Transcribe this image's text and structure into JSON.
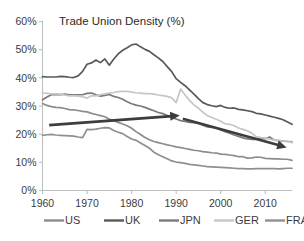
{
  "chart_data": {
    "type": "line",
    "title": "Trade Union Density (%)",
    "xlabel": "",
    "ylabel": "",
    "xlim": [
      1960,
      2016
    ],
    "ylim": [
      0,
      60
    ],
    "grid": false,
    "legend_position": "bottom",
    "ytick_labels": [
      "0%",
      "10%",
      "20%",
      "30%",
      "40%",
      "50%",
      "60%"
    ],
    "ytick_values": [
      0,
      10,
      20,
      30,
      40,
      50,
      60
    ],
    "xtick_labels": [
      "1960",
      "1970",
      "1980",
      "1990",
      "2000",
      "2010"
    ],
    "xtick_values": [
      1960,
      1970,
      1980,
      1990,
      2000,
      2010
    ],
    "x": [
      1960,
      1961,
      1962,
      1963,
      1964,
      1965,
      1966,
      1967,
      1968,
      1969,
      1970,
      1971,
      1972,
      1973,
      1974,
      1975,
      1976,
      1977,
      1978,
      1979,
      1980,
      1981,
      1982,
      1983,
      1984,
      1985,
      1986,
      1987,
      1988,
      1989,
      1990,
      1991,
      1992,
      1993,
      1994,
      1995,
      1996,
      1997,
      1998,
      1999,
      2000,
      2001,
      2002,
      2003,
      2004,
      2005,
      2006,
      2007,
      2008,
      2009,
      2010,
      2011,
      2012,
      2013,
      2014,
      2015,
      2016
    ],
    "series": [
      {
        "name": "US",
        "color": "#8c8c8c",
        "values": [
          30.9,
          30.2,
          29.8,
          29.5,
          29.4,
          29.1,
          28.7,
          28.6,
          28.4,
          28.1,
          27.9,
          27.4,
          27.0,
          26.6,
          26.2,
          25.3,
          24.8,
          24.2,
          23.6,
          23.0,
          22.1,
          20.9,
          19.9,
          18.8,
          18.0,
          17.4,
          17.0,
          16.6,
          16.2,
          15.9,
          15.5,
          15.2,
          14.9,
          14.6,
          14.3,
          14.1,
          13.8,
          13.6,
          13.4,
          13.3,
          12.9,
          12.8,
          12.6,
          12.4,
          12.0,
          12.0,
          11.5,
          11.6,
          11.9,
          11.8,
          11.4,
          11.3,
          11.2,
          11.2,
          11.1,
          11.1,
          10.7
        ]
      },
      {
        "name": "UK",
        "color": "#595959",
        "values": [
          40.4,
          40.3,
          40.3,
          40.3,
          40.5,
          40.4,
          40.2,
          40.1,
          40.7,
          42.3,
          44.8,
          45.3,
          46.3,
          45.4,
          46.7,
          44.5,
          46.7,
          48.5,
          49.8,
          50.7,
          51.7,
          52.0,
          51.0,
          50.1,
          49.4,
          48.2,
          47.1,
          45.8,
          44.0,
          42.2,
          39.7,
          38.4,
          37.2,
          35.7,
          34.2,
          32.6,
          31.2,
          30.5,
          30.1,
          29.8,
          30.2,
          29.5,
          29.2,
          29.3,
          28.8,
          28.6,
          28.3,
          28.0,
          27.4,
          27.2,
          26.8,
          26.4,
          26.0,
          25.6,
          25.1,
          24.3,
          23.5
        ]
      },
      {
        "name": "JPN",
        "color": "#7a7a7a",
        "values": [
          32.2,
          33.2,
          34.0,
          34.0,
          34.0,
          34.2,
          34.0,
          34.0,
          34.0,
          34.0,
          34.5,
          34.6,
          34.0,
          33.5,
          33.8,
          34.1,
          33.4,
          33.0,
          32.4,
          31.5,
          30.8,
          30.3,
          30.0,
          29.5,
          28.9,
          28.3,
          27.7,
          27.3,
          26.6,
          25.9,
          25.4,
          24.8,
          24.5,
          24.2,
          24.1,
          23.8,
          23.2,
          22.6,
          22.4,
          22.2,
          21.5,
          20.9,
          20.3,
          19.7,
          19.2,
          18.7,
          18.3,
          18.1,
          18.1,
          18.5,
          18.4,
          19.0,
          17.9,
          17.7,
          17.5,
          17.4,
          17.3
        ]
      },
      {
        "name": "GER",
        "color": "#c6c6c6",
        "values": [
          34.7,
          34.5,
          34.3,
          34.3,
          34.2,
          33.9,
          33.6,
          33.7,
          33.5,
          33.3,
          32.8,
          33.6,
          33.6,
          34.0,
          34.3,
          34.6,
          34.8,
          35.1,
          35.2,
          35.2,
          34.9,
          34.7,
          34.6,
          34.4,
          34.4,
          34.2,
          33.9,
          33.7,
          33.4,
          32.9,
          31.2,
          36.0,
          33.9,
          32.0,
          30.4,
          29.2,
          27.8,
          26.6,
          25.9,
          25.3,
          24.6,
          23.7,
          23.5,
          23.0,
          22.2,
          21.7,
          21.2,
          20.3,
          19.1,
          18.8,
          18.6,
          18.2,
          17.9,
          17.8,
          17.6,
          17.5,
          17.0
        ]
      },
      {
        "name": "FRA",
        "color": "#8f8f8f",
        "values": [
          19.6,
          19.8,
          19.9,
          19.7,
          19.6,
          19.5,
          19.4,
          19.3,
          19.0,
          18.8,
          21.7,
          21.6,
          21.8,
          22.1,
          22.3,
          22.2,
          21.3,
          20.7,
          20.2,
          19.2,
          18.3,
          17.8,
          16.9,
          16.0,
          15.0,
          13.6,
          12.7,
          12.0,
          11.3,
          10.5,
          10.1,
          9.9,
          9.6,
          9.3,
          9.1,
          8.9,
          8.7,
          8.5,
          8.4,
          8.3,
          8.2,
          8.1,
          8.0,
          7.9,
          7.8,
          7.8,
          7.7,
          7.7,
          7.8,
          7.8,
          7.8,
          7.8,
          7.8,
          7.7,
          7.8,
          7.9,
          7.9
        ]
      }
    ],
    "annotations": [
      {
        "name": "rising-trend-arrow",
        "type": "arrow",
        "x_start": 1961.5,
        "y_start": 23.2,
        "x_end": 1990.8,
        "y_end": 26.6,
        "color": "#3d3d3d"
      },
      {
        "name": "falling-trend-arrow",
        "type": "arrow",
        "x_start": 1991.5,
        "y_start": 25.5,
        "x_end": 2014.8,
        "y_end": 15.3,
        "color": "#3d3d3d"
      }
    ],
    "legend": [
      {
        "label": "US",
        "color": "#8c8c8c"
      },
      {
        "label": "UK",
        "color": "#595959"
      },
      {
        "label": "JPN",
        "color": "#7a7a7a"
      },
      {
        "label": "GER",
        "color": "#c6c6c6"
      },
      {
        "label": "FRA",
        "color": "#8f8f8f"
      }
    ]
  }
}
